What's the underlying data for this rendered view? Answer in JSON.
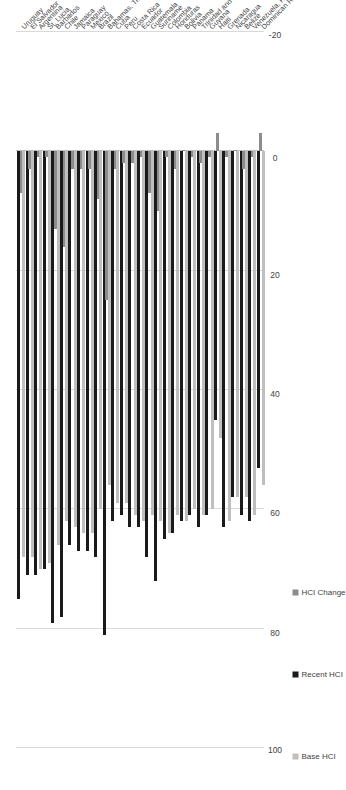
{
  "chart_data": {
    "type": "bar",
    "orientation": "horizontal-rotated",
    "title": "",
    "xlabel": "",
    "ylabel": "",
    "ylim": [
      -20,
      100
    ],
    "grid": true,
    "legend_position": "bottom-left",
    "ticks": [
      "100",
      "80",
      "60",
      "40",
      "20",
      "0",
      "-20"
    ],
    "categories": [
      "Uruguay",
      "El Salvador",
      "Argentina",
      "St. Lucia",
      "Barbados",
      "Chile",
      "Jamaica",
      "Paraguay",
      "Mexico",
      "Brazil",
      "Bahamas, The",
      "Cuba",
      "Peru",
      "Costa Rica",
      "Ecuador",
      "Guatemala",
      "Suriname",
      "Colombia",
      "Honduras",
      "Bolivia",
      "Panama",
      "Trinidad and Tobago",
      "Guyana",
      "Haiti",
      "Grenada",
      "Nicaragua",
      "Belize",
      "Venezuela, RB",
      "Dominican Republic"
    ],
    "series": [
      {
        "name": "Base HCI",
        "color": "#bfbfbf",
        "values": [
          68,
          68,
          70,
          69,
          66,
          62,
          63,
          64,
          64,
          60,
          56,
          59,
          59,
          61,
          62,
          61,
          62,
          64,
          61,
          62,
          60,
          61,
          60,
          48,
          62,
          58,
          58,
          61,
          56
        ]
      },
      {
        "name": "Recent HCI",
        "color": "#1a1a1a",
        "values": [
          75,
          71,
          71,
          70,
          79,
          78,
          66,
          67,
          67,
          68,
          81,
          62,
          61,
          63,
          63,
          68,
          72,
          65,
          64,
          62,
          61,
          63,
          61,
          45,
          63,
          58,
          61,
          62,
          53
        ]
      },
      {
        "name": "HCI Change",
        "color": "#8c8c8c",
        "values": [
          7,
          3,
          1,
          1,
          13,
          16,
          3,
          3,
          3,
          8,
          25,
          3,
          2,
          2,
          1,
          7,
          10,
          1,
          3,
          0,
          1,
          2,
          1,
          -3,
          1,
          0,
          3,
          1,
          -3
        ]
      }
    ]
  },
  "legend": {
    "items": [
      {
        "label": "Base HCI",
        "color": "#bfbfbf"
      },
      {
        "label": "Recent HCI",
        "color": "#1a1a1a"
      },
      {
        "label": "HCI Change",
        "color": "#8c8c8c"
      }
    ]
  }
}
